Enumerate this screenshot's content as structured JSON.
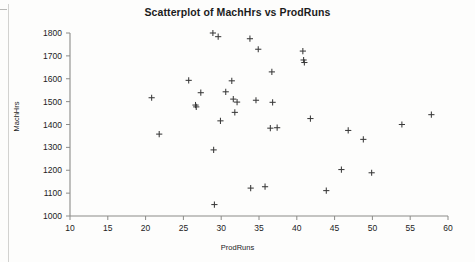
{
  "chart_data": {
    "type": "scatter",
    "title": "Scatterplot of MachHrs vs ProdRuns",
    "xlabel": "ProdRuns",
    "ylabel": "MachHrs",
    "xlim": [
      10,
      60
    ],
    "ylim": [
      1000,
      1800
    ],
    "xticks": [
      10,
      15,
      20,
      25,
      30,
      35,
      40,
      45,
      50,
      55,
      60
    ],
    "yticks": [
      1000,
      1100,
      1200,
      1300,
      1400,
      1500,
      1600,
      1700,
      1800
    ],
    "grid": false,
    "legend": "none",
    "marker_symbol": "plus",
    "marker_color": "#3a3a3a",
    "series": [
      {
        "name": "MachHrs vs ProdRuns",
        "points": [
          [
            20.8,
            1517
          ],
          [
            21.8,
            1358
          ],
          [
            25.7,
            1593
          ],
          [
            26.6,
            1485
          ],
          [
            26.7,
            1477
          ],
          [
            27.3,
            1539
          ],
          [
            28.9,
            1800
          ],
          [
            29.0,
            1289
          ],
          [
            29.1,
            1050
          ],
          [
            29.6,
            1784
          ],
          [
            29.9,
            1416
          ],
          [
            30.6,
            1543
          ],
          [
            31.4,
            1591
          ],
          [
            31.6,
            1511
          ],
          [
            31.8,
            1453
          ],
          [
            32.1,
            1498
          ],
          [
            33.8,
            1775
          ],
          [
            33.9,
            1122
          ],
          [
            34.6,
            1506
          ],
          [
            34.9,
            1729
          ],
          [
            35.8,
            1128
          ],
          [
            36.5,
            1384
          ],
          [
            36.7,
            1630
          ],
          [
            36.8,
            1497
          ],
          [
            37.4,
            1386
          ],
          [
            40.8,
            1721
          ],
          [
            40.9,
            1682
          ],
          [
            41.0,
            1671
          ],
          [
            41.8,
            1426
          ],
          [
            43.9,
            1111
          ],
          [
            45.9,
            1203
          ],
          [
            46.8,
            1374
          ],
          [
            48.8,
            1335
          ],
          [
            49.9,
            1189
          ],
          [
            53.9,
            1400
          ],
          [
            57.8,
            1443
          ]
        ]
      }
    ]
  },
  "figure": {
    "title": "Scatterplot of MachHrs vs ProdRuns",
    "x_axis_label": "ProdRuns",
    "y_axis_label": "MachHrs"
  }
}
